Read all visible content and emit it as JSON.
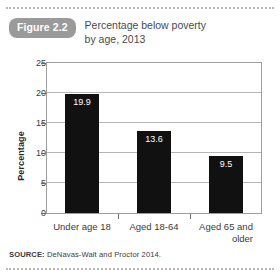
{
  "figure": {
    "badge": "Figure 2.2",
    "title_line1": "Percentage below poverty",
    "title_line2": "by age, 2013",
    "source_label": "SOURCE:",
    "source_text": "DeNavas-Walt and Proctor 2014.",
    "badge_color": "#9a9a9a",
    "bar_color": "#111111",
    "rule_color": "#b9b9b9"
  },
  "chart_data": {
    "type": "bar",
    "title": "Percentage below poverty by age, 2013",
    "xlabel": "",
    "ylabel": "Percentage",
    "categories": [
      "Under age 18",
      "Aged 18-64",
      "Aged 65 and older"
    ],
    "category_lines": [
      {
        "line1": "Under age 18",
        "line2": ""
      },
      {
        "line1": "Aged 18-64",
        "line2": ""
      },
      {
        "line1": "Aged 65 and",
        "line2": "older"
      }
    ],
    "values": [
      19.9,
      13.6,
      9.5
    ],
    "value_labels": [
      "19.9",
      "13.6",
      "9.5"
    ],
    "ylim": [
      0,
      25
    ],
    "yticks": [
      0,
      5,
      10,
      15,
      20,
      25
    ],
    "ytick_labels": [
      "0",
      "5",
      "10",
      "15",
      "20",
      "25"
    ],
    "grid": true,
    "legend": false
  }
}
